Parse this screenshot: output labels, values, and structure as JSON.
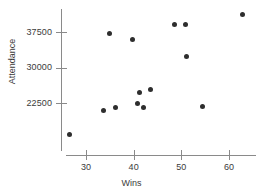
{
  "chart_data": {
    "type": "scatter",
    "title": "",
    "xlabel": "Wins",
    "ylabel": "Attendance",
    "xlim": [
      25,
      65
    ],
    "ylim": [
      14000,
      42500
    ],
    "xticks": [
      30,
      40,
      50,
      60
    ],
    "xtick_labels": [
      "30",
      "40",
      "50",
      "60"
    ],
    "yticks": [
      22500,
      30000,
      37500
    ],
    "ytick_labels": [
      "22500",
      "30000",
      "37500"
    ],
    "grid": false,
    "legend": null,
    "marker_color": "#2e2e2e",
    "axis_color": "#8a8a8a",
    "points": [
      {
        "x": 26.6,
        "y": 15800
      },
      {
        "x": 33.6,
        "y": 20900
      },
      {
        "x": 36.1,
        "y": 21500
      },
      {
        "x": 35.0,
        "y": 37200
      },
      {
        "x": 39.8,
        "y": 35900
      },
      {
        "x": 40.9,
        "y": 22300
      },
      {
        "x": 42.1,
        "y": 21500
      },
      {
        "x": 41.3,
        "y": 24800
      },
      {
        "x": 43.6,
        "y": 25400
      },
      {
        "x": 48.6,
        "y": 39000
      },
      {
        "x": 50.9,
        "y": 39000
      },
      {
        "x": 51.1,
        "y": 32400
      },
      {
        "x": 54.5,
        "y": 21700
      },
      {
        "x": 62.9,
        "y": 41100
      }
    ]
  }
}
